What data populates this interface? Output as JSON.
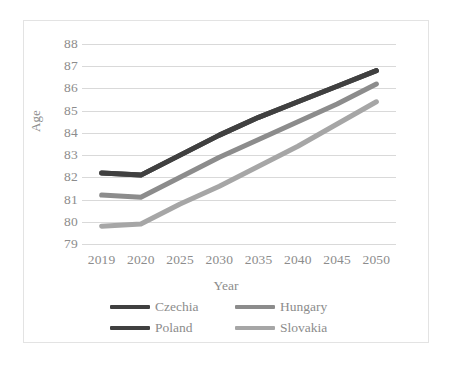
{
  "chart_data": {
    "type": "line",
    "title": "",
    "subtitle": "",
    "xlabel": "Year",
    "ylabel": "Age",
    "categories": [
      "2019",
      "2020",
      "2025",
      "2030",
      "2035",
      "2040",
      "2045",
      "2050"
    ],
    "x": [
      2019,
      2020,
      2025,
      2030,
      2035,
      2040,
      2045,
      2050
    ],
    "ylim": [
      79,
      88
    ],
    "ytick_labels": [
      "88",
      "87",
      "86",
      "85",
      "84",
      "83",
      "82",
      "81",
      "80",
      "79"
    ],
    "yticks": [
      88,
      87,
      86,
      85,
      84,
      83,
      82,
      81,
      80,
      79
    ],
    "grid": true,
    "grid_axis": "y",
    "legend_position": "bottom",
    "series": [
      {
        "name": "Czechia",
        "color": "#404040",
        "values": [
          82.2,
          82.1,
          83.0,
          83.9,
          84.7,
          85.4,
          86.1,
          86.8
        ]
      },
      {
        "name": "Hungary",
        "color": "#8c8c8c",
        "values": [
          81.2,
          81.1,
          82.0,
          82.9,
          83.7,
          84.5,
          85.3,
          86.2
        ]
      },
      {
        "name": "Poland",
        "color": "#404040",
        "values": [
          82.2,
          82.1,
          83.0,
          83.9,
          84.7,
          85.4,
          86.1,
          86.8
        ]
      },
      {
        "name": "Slovakia",
        "color": "#a6a6a6",
        "values": [
          79.8,
          79.9,
          80.8,
          81.6,
          82.5,
          83.4,
          84.4,
          85.4
        ]
      }
    ]
  },
  "legend": {
    "rows": [
      [
        {
          "label": "Czechia",
          "color": "#404040"
        },
        {
          "label": "Hungary",
          "color": "#8c8c8c"
        }
      ],
      [
        {
          "label": "Poland",
          "color": "#404040"
        },
        {
          "label": "Slovakia",
          "color": "#a6a6a6"
        }
      ]
    ]
  },
  "colors": {
    "gridline": "#d9d9d9",
    "text": "#8c8c8c",
    "frame": "#e3e3e3",
    "background": "#ffffff"
  }
}
